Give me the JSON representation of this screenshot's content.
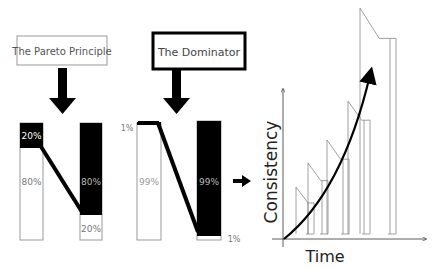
{
  "pareto": {
    "title": "The Pareto Principle",
    "left_bar": {
      "top_label": "20%",
      "bottom_label": "80%",
      "top_fraction": 0.2
    },
    "right_bar": {
      "top_label": "80%",
      "bottom_label": "20%",
      "top_fraction": 0.8
    }
  },
  "dominator": {
    "title": "The Dominator",
    "left_bar": {
      "top_label": "1%",
      "bottom_label": "99%",
      "top_fraction": 0.01
    },
    "right_bar": {
      "top_label": "99%",
      "bottom_label": "1%",
      "top_fraction": 0.99
    }
  },
  "growth_chart": {
    "y_label": "Consistency",
    "x_label": "Time",
    "steps": 6
  },
  "colors": {
    "ink": "#000000",
    "text_gray": "#666666",
    "outline": "#999999"
  }
}
